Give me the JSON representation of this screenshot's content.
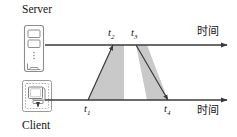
{
  "diagram": {
    "type": "timing-sequence-diagram",
    "nodes": [
      {
        "id": "server",
        "label": "Server",
        "icon": "server-tower-icon"
      },
      {
        "id": "client",
        "label": "Client",
        "icon": "client-monitor-icon"
      }
    ],
    "axes": [
      {
        "id": "server-timeline",
        "label": "时间",
        "y": 45,
        "x_start": 45,
        "x_end": 228
      },
      {
        "id": "client-timeline",
        "label": "时间",
        "y": 100,
        "x_start": 45,
        "x_end": 228
      }
    ],
    "time_markers": [
      {
        "id": "t1",
        "text": "t",
        "sub": "1",
        "x": 88,
        "axis": "client-timeline",
        "position": "below"
      },
      {
        "id": "t2",
        "text": "t",
        "sub": "2",
        "x": 113,
        "axis": "server-timeline",
        "position": "above"
      },
      {
        "id": "t3",
        "text": "t",
        "sub": "3",
        "x": 136,
        "axis": "server-timeline",
        "position": "above"
      },
      {
        "id": "t4",
        "text": "t",
        "sub": "4",
        "x": 168,
        "axis": "client-timeline",
        "position": "below"
      }
    ],
    "transmissions": [
      {
        "id": "request",
        "from": "client",
        "to": "server",
        "start_marker": "t1",
        "end_marker": "t2",
        "shape": "triangle"
      },
      {
        "id": "response",
        "from": "server",
        "to": "client",
        "start_marker": "t3",
        "end_marker": "t4",
        "shape": "triangle"
      }
    ],
    "colors": {
      "line": "#3a3a3a",
      "fill": "#c9c9c9",
      "icon_stroke": "#8a8a8a",
      "text": "#141414",
      "background": "#ffffff"
    }
  }
}
